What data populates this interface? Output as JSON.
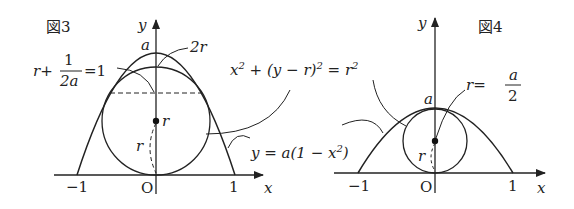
{
  "figures": [
    {
      "id": "fig3",
      "title": "図3",
      "axes": {
        "x_label": "x",
        "y_label": "y",
        "origin_label": "O",
        "x_ticks": [
          "−1",
          "1"
        ]
      },
      "curve_label": "y = a(1−x²)",
      "circle_label": "x² + (y−r)² = r²",
      "labels": {
        "apex": "a",
        "top_of_circle": "2r",
        "center": "r",
        "radius": "r",
        "condition": {
          "prefix": "r+",
          "num": "1",
          "den": "2a",
          "suffix": "=1"
        }
      }
    },
    {
      "id": "fig4",
      "title": "図4",
      "axes": {
        "x_label": "x",
        "y_label": "y",
        "origin_label": "O",
        "x_ticks": [
          "−1",
          "1"
        ]
      },
      "labels": {
        "apex": "a",
        "radius": "r",
        "condition": {
          "prefix": "r=",
          "num": "a",
          "den": "2"
        }
      }
    }
  ],
  "shared_labels": {
    "circle_eq": {
      "p1": "x",
      "sup1": "2",
      "p2": " + (y − r)",
      "sup2": "2",
      "p3": " = r",
      "sup3": "2"
    },
    "curve_eq": {
      "p1": "y = a(1 − x",
      "sup": "2",
      "p2": ")"
    }
  }
}
